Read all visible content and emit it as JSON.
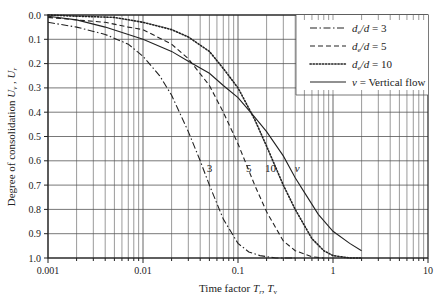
{
  "chart_data": {
    "type": "line",
    "title": "",
    "xlabel": "Time factor T_r, T_v",
    "xlabel_parts": {
      "main": "Time factor ",
      "sym1": "T",
      "sub1": "r",
      "sep": ", ",
      "sym2": "T",
      "sub2": "v"
    },
    "ylabel": "Degree of consolidation U_v, U_r",
    "ylabel_parts": {
      "main": "Degree of consolidation ",
      "sym1": "U",
      "sub1": "v",
      "sep": " , ",
      "sym2": "U",
      "sub2": "r"
    },
    "xscale": "log",
    "xlim": [
      0.001,
      10
    ],
    "ylim": [
      0.0,
      1.0
    ],
    "y_inverted": true,
    "grid": true,
    "x_ticks": [
      0.001,
      0.01,
      0.1,
      1,
      10
    ],
    "x_tick_labels": [
      "0.001",
      "0.01",
      "0.1",
      "1",
      "10"
    ],
    "y_ticks": [
      0.0,
      0.1,
      0.2,
      0.3,
      0.4,
      0.5,
      0.6,
      0.7,
      0.8,
      0.9,
      1.0
    ],
    "y_tick_labels": [
      "0.0",
      "0.1",
      "0.2",
      "0.3",
      "0.4",
      "0.5",
      "0.6",
      "0.7",
      "0.8",
      "0.9",
      "1.0"
    ],
    "legend_position": "upper right",
    "series": [
      {
        "name": "de/d = 3",
        "legend_parts": {
          "sym": "d",
          "sub": "e",
          "rest": "/d = 3"
        },
        "style": "dashdot",
        "curve_label": "3",
        "x": [
          0.001,
          0.002,
          0.004,
          0.007,
          0.01,
          0.015,
          0.02,
          0.03,
          0.04,
          0.05,
          0.07,
          0.1,
          0.13,
          0.17,
          0.25,
          0.4
        ],
        "y": [
          0.03,
          0.05,
          0.08,
          0.12,
          0.17,
          0.25,
          0.33,
          0.48,
          0.6,
          0.7,
          0.84,
          0.94,
          0.975,
          0.99,
          1.0,
          1.0
        ]
      },
      {
        "name": "de/d = 5",
        "legend_parts": {
          "sym": "d",
          "sub": "e",
          "rest": "/d = 5"
        },
        "style": "dashed",
        "curve_label": "5",
        "x": [
          0.001,
          0.002,
          0.004,
          0.007,
          0.01,
          0.02,
          0.03,
          0.05,
          0.07,
          0.1,
          0.15,
          0.2,
          0.3,
          0.4,
          0.6,
          0.8
        ],
        "y": [
          0.01,
          0.02,
          0.03,
          0.05,
          0.06,
          0.12,
          0.18,
          0.29,
          0.4,
          0.53,
          0.7,
          0.81,
          0.93,
          0.97,
          0.995,
          1.0
        ]
      },
      {
        "name": "de/d = 10",
        "legend_parts": {
          "sym": "d",
          "sub": "e",
          "rest": "/d = 10"
        },
        "style": "dotted",
        "curve_label": "10",
        "x": [
          0.001,
          0.002,
          0.005,
          0.01,
          0.02,
          0.03,
          0.05,
          0.07,
          0.1,
          0.15,
          0.2,
          0.3,
          0.4,
          0.6,
          0.8,
          1.0,
          1.5,
          2.0
        ],
        "y": [
          0.0,
          0.005,
          0.01,
          0.03,
          0.06,
          0.09,
          0.15,
          0.22,
          0.3,
          0.43,
          0.54,
          0.7,
          0.8,
          0.92,
          0.97,
          0.99,
          1.0,
          1.0
        ]
      },
      {
        "name": "v = Vertical flow",
        "legend_parts": {
          "sym": "v",
          "sub": "",
          "rest": " = Vertical flow"
        },
        "style": "solid",
        "curve_label": "v",
        "x": [
          0.001,
          0.002,
          0.004,
          0.007,
          0.01,
          0.02,
          0.03,
          0.05,
          0.07,
          0.1,
          0.15,
          0.2,
          0.3,
          0.4,
          0.5,
          0.7,
          1.0,
          1.5,
          2.0
        ],
        "y": [
          0.005,
          0.02,
          0.05,
          0.08,
          0.1,
          0.15,
          0.19,
          0.24,
          0.29,
          0.34,
          0.42,
          0.48,
          0.58,
          0.67,
          0.73,
          0.82,
          0.89,
          0.94,
          0.97
        ]
      }
    ],
    "annotations": [
      {
        "text": "3",
        "x": 0.05,
        "y": 0.63
      },
      {
        "text": "5",
        "x": 0.13,
        "y": 0.63
      },
      {
        "text": "10",
        "x": 0.22,
        "y": 0.63
      },
      {
        "text": "v",
        "x": 0.42,
        "y": 0.63
      }
    ]
  },
  "colors": {
    "axis": "#222222",
    "grid": "#555555",
    "curve": "#222222",
    "background": "#ffffff"
  }
}
